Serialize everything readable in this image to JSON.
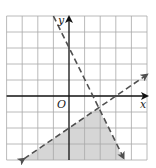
{
  "figure": {
    "type": "system-of-linear-inequalities-graph",
    "axes": {
      "x_label": "x",
      "y_label": "y",
      "origin_label": "O"
    },
    "grid": {
      "x_min": -4,
      "x_max": 5,
      "y_min": -4,
      "y_max": 5,
      "step": 1
    },
    "lines": [
      {
        "name": "steep-boundary",
        "equation": "y = -2x + 3",
        "style": "dashed",
        "from": [
          -1,
          5
        ],
        "to": [
          3.5,
          -4
        ],
        "arrow_end": "bottom"
      },
      {
        "name": "gentle-boundary",
        "equation": "y = (2/3)x - 2",
        "style": "dashed",
        "from": [
          -3,
          -4
        ],
        "to": [
          5,
          1.33
        ],
        "arrow_end": "both"
      }
    ],
    "shaded_region": {
      "description": "Region below y = (2/3)x - 2 and left of y = -2x + 3",
      "vertices": [
        [
          -3,
          -4
        ],
        [
          1.875,
          -0.75
        ],
        [
          3.5,
          -4
        ]
      ]
    },
    "colors": {
      "grid": "#a8a8a8",
      "axes": "#111111",
      "dashed_lines": "#505050",
      "shading": "#d6d6d6",
      "background": "#ffffff"
    }
  }
}
